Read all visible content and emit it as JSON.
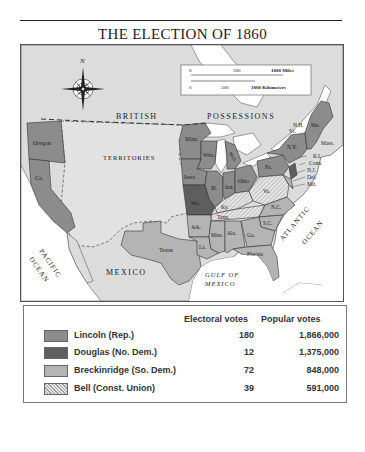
{
  "title": "THE ELECTION OF 1860",
  "map": {
    "compass_label": "N",
    "scale": {
      "miles": [
        "0",
        "500",
        "1000 Miles"
      ],
      "kilometers": [
        "0",
        "500",
        "1000 Kilometers"
      ]
    },
    "region_labels": {
      "british": "BRITISH",
      "possessions": "POSSESSIONS",
      "territories": "TERRITORIES",
      "mexico": "MEXICO",
      "pacific_1": "PACIFIC",
      "pacific_2": "OCEAN",
      "atlantic_1": "ATLANTIC",
      "atlantic_2": "OCEAN",
      "gulf_1": "GULF OF",
      "gulf_2": "MEXICO"
    },
    "state_labels": {
      "oregon": "Oregon",
      "ca": "Ca.",
      "texas": "Texas",
      "minn": "Minn.",
      "wisc": "Wisc.",
      "mich": "Mich.",
      "iowa": "Iowa",
      "ill": "Ill.",
      "ind": "Ind.",
      "ohio": "Ohio",
      "mo": "Mo.",
      "ky": "Ky.",
      "tenn": "Tenn.",
      "va": "Va.",
      "nc": "N.C.",
      "sc": "S.C.",
      "ark": "Ark.",
      "miss": "Miss.",
      "ala": "Ala.",
      "ga": "Ga.",
      "la": "La.",
      "florida": "Florida",
      "pa": "Pa.",
      "ny": "N.Y.",
      "nh": "N.H.",
      "vt": "Vt.",
      "me": "Me.",
      "mass": "Mass.",
      "ri": "R.I.",
      "conn": "Conn.",
      "nj": "N.J.",
      "del": "Del.",
      "md": "Md."
    },
    "colors": {
      "land_foreign": "#dcdcdc",
      "water": "#ffffff",
      "lincoln": "#8c8c8c",
      "douglas": "#5e5e5e",
      "breckinridge": "#b4b4b4",
      "bell_base": "#e4e4e4",
      "bell_hatch": "#a0a0a0",
      "territories": "#e2e2e2"
    }
  },
  "legend": {
    "headers": {
      "electoral": "Electoral votes",
      "popular": "Popular votes"
    },
    "rows": [
      {
        "candidate": "Lincoln (Rep.)",
        "electoral": "180",
        "popular": "1,866,000",
        "swatch": "#8c8c8c"
      },
      {
        "candidate": "Douglas (No. Dem.)",
        "electoral": "12",
        "popular": "1,375,000",
        "swatch": "#5e5e5e"
      },
      {
        "candidate": "Breckinridge (So. Dem.)",
        "electoral": "72",
        "popular": "848,000",
        "swatch": "#b4b4b4"
      },
      {
        "candidate": "Bell (Const. Union)",
        "electoral": "39",
        "popular": "591,000",
        "swatch": "hatch"
      }
    ]
  }
}
